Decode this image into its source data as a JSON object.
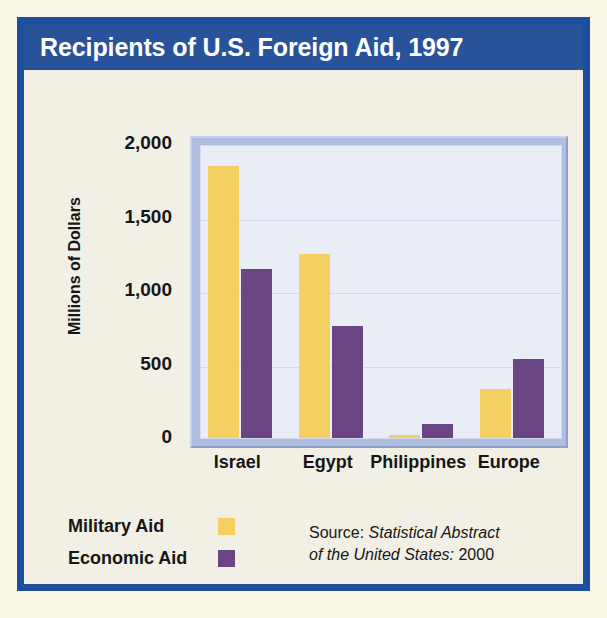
{
  "title": "Recipients of U.S. Foreign Aid, 1997",
  "legend": {
    "items": [
      {
        "label": "Military Aid",
        "color": "#F5CF62",
        "swatch_name": "military-aid-swatch"
      },
      {
        "label": "Economic Aid",
        "color": "#6B4483",
        "swatch_name": "economic-aid-swatch"
      }
    ]
  },
  "source": {
    "prefix": "Source: ",
    "italic_line1": "Statistical Abstract",
    "italic_line2": "of the United States:",
    "year": " 2000",
    "full": "Source: Statistical Abstract of the United States: 2000"
  },
  "colors": {
    "banner": "#28539B",
    "border": "#1F4E9C",
    "card_bg": "#F2EFE4",
    "page_bg": "#FBF7E8",
    "plot_bg": "#E9EDF6",
    "plot_frame": "#AEBEE0",
    "military": "#F5CF62",
    "economic": "#6B4483",
    "gridline": "#D2D9EA",
    "text": "#161616"
  },
  "chart_data": {
    "type": "bar",
    "title": "Recipients of U.S. Foreign Aid, 1997",
    "xlabel": "",
    "ylabel": "Millions of Dollars",
    "categories": [
      "Israel",
      "Egypt",
      "Philippines",
      "Europe"
    ],
    "series": [
      {
        "name": "Military Aid",
        "color": "#F5CF62",
        "values": [
          1850,
          1250,
          20,
          335
        ]
      },
      {
        "name": "Economic Aid",
        "color": "#6B4483",
        "values": [
          1150,
          765,
          95,
          540
        ]
      }
    ],
    "ylim": [
      0,
      2000
    ],
    "yticks": [
      0,
      500,
      1000,
      1500,
      2000
    ],
    "ytick_labels": [
      "0",
      "500",
      "1,000",
      "1,500",
      "2,000"
    ],
    "grid": true,
    "legend_position": "bottom-left",
    "annotations": [
      "Source: Statistical Abstract of the United States: 2000"
    ]
  }
}
